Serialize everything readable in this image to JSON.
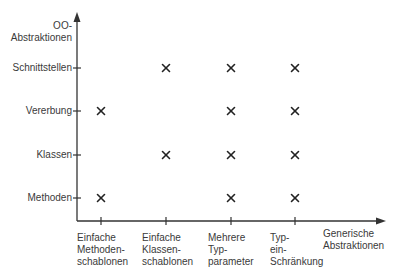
{
  "diagram": {
    "y_axis_title": "OO-\nAbstraktionen",
    "x_axis_title": "Generische\nAbstraktionen",
    "y_categories": [
      "Methoden",
      "Klassen",
      "Vererbung",
      "Schnittstellen"
    ],
    "x_categories": [
      "Einfache\nMethoden-\nschablonen",
      "Einfache\nKlassen-\nschablonen",
      "Mehrere\nTyp-\nparameter",
      "Typ-\nein-\nSchränkung"
    ],
    "marker": "×",
    "marks": [
      {
        "x": 0,
        "y": 0
      },
      {
        "x": 2,
        "y": 0
      },
      {
        "x": 3,
        "y": 0
      },
      {
        "x": 1,
        "y": 1
      },
      {
        "x": 2,
        "y": 1
      },
      {
        "x": 3,
        "y": 1
      },
      {
        "x": 0,
        "y": 2
      },
      {
        "x": 2,
        "y": 2
      },
      {
        "x": 3,
        "y": 2
      },
      {
        "x": 1,
        "y": 3
      },
      {
        "x": 2,
        "y": 3
      },
      {
        "x": 3,
        "y": 3
      }
    ],
    "colors": {
      "axis": "#333333",
      "text": "#3a3a3a",
      "marker": "#222222"
    }
  },
  "chart_data": {
    "type": "table",
    "title": "",
    "xlabel": "Generische Abstraktionen",
    "ylabel": "OO-Abstraktionen",
    "x": [
      "Einfache Methodenschablonen",
      "Einfache Klassenschablonen",
      "Mehrere Typparameter",
      "Typeinschränkung"
    ],
    "y": [
      "Methoden",
      "Klassen",
      "Vererbung",
      "Schnittstellen"
    ],
    "matrix": {
      "Schnittstellen": [
        false,
        true,
        true,
        true
      ],
      "Vererbung": [
        true,
        false,
        true,
        true
      ],
      "Klassen": [
        false,
        true,
        true,
        true
      ],
      "Methoden": [
        true,
        false,
        true,
        true
      ]
    },
    "grid": false,
    "legend": "none"
  }
}
